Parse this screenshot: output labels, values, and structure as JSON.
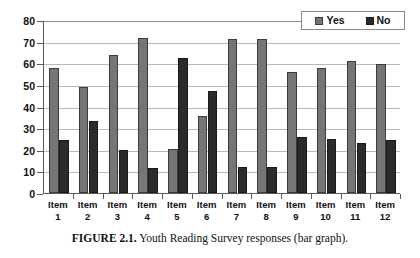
{
  "caption": {
    "label": "FIGURE 2.1.",
    "text": " Youth Reading Survey responses (bar graph)."
  },
  "legend": {
    "position": "top-right",
    "entries": [
      {
        "label": "Yes",
        "color": "#767676",
        "icon": "legend-swatch-yes"
      },
      {
        "label": "No",
        "color": "#2b2b2b",
        "icon": "legend-swatch-no"
      }
    ]
  },
  "chart_data": {
    "type": "bar",
    "title": "",
    "subtitle": "",
    "xlabel": "",
    "ylabel": "",
    "ylim": [
      0,
      80
    ],
    "yticks": [
      0,
      10,
      20,
      30,
      40,
      50,
      60,
      70,
      80
    ],
    "grid": true,
    "legend_position": "top-right",
    "categories": [
      "Item 1",
      "Item 2",
      "Item 3",
      "Item 4",
      "Item 5",
      "Item 6",
      "Item 7",
      "Item 8",
      "Item 9",
      "Item 10",
      "Item 11",
      "Item 12"
    ],
    "category_lines": [
      [
        "Item",
        "1"
      ],
      [
        "Item",
        "2"
      ],
      [
        "Item",
        "3"
      ],
      [
        "Item",
        "4"
      ],
      [
        "Item",
        "5"
      ],
      [
        "Item",
        "6"
      ],
      [
        "Item",
        "7"
      ],
      [
        "Item",
        "8"
      ],
      [
        "Item",
        "9"
      ],
      [
        "Item",
        "10"
      ],
      [
        "Item",
        "11"
      ],
      [
        "Item",
        "12"
      ]
    ],
    "series": [
      {
        "name": "Yes",
        "color": "#767676",
        "values": [
          58,
          49,
          64,
          71.5,
          20.5,
          35.5,
          71,
          71,
          56,
          58,
          61,
          59.5
        ]
      },
      {
        "name": "No",
        "color": "#2b2b2b",
        "values": [
          24.5,
          33.5,
          20,
          11.5,
          62.5,
          47,
          12,
          12,
          26,
          25,
          23,
          24.5
        ]
      }
    ]
  }
}
